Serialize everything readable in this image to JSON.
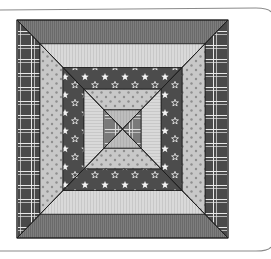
{
  "canvas": {
    "width": 271,
    "height": 259,
    "background": "#ffffff"
  },
  "frame": {
    "stroke": "#8a8a8a",
    "top_y": 8,
    "bottom_y": 251,
    "right_x": 268,
    "corner_radius": 12
  },
  "quilt": {
    "bounds": {
      "x0": 17,
      "y0": 20,
      "x1": 228,
      "y1": 238
    },
    "seam_color": "#1e1e1e",
    "rings": [
      {
        "name": "outer",
        "top_bottom": "dark-stripe",
        "left_right": "plaid"
      },
      {
        "name": "second",
        "top_bottom": "light-stripe",
        "left_right": "pink-dot"
      },
      {
        "name": "third",
        "top_bottom": "stars",
        "left_right": "stars"
      },
      {
        "name": "fourth",
        "top_bottom": "pink-dot",
        "left_right": "light-stripe"
      }
    ],
    "ring_insets": [
      0,
      23,
      46,
      67,
      87
    ],
    "center": {
      "top_bottom": "light-gray",
      "left_right": "plaid-mid"
    },
    "fabrics": {
      "dark-stripe": {
        "base": "#7d7d7d",
        "line": "#6a6a6a"
      },
      "light-stripe": {
        "base": "#d9d9d9",
        "line": "#c8c8c8"
      },
      "plaid": {
        "base": "#4a4a4a",
        "line": "#e8e8e8"
      },
      "pink-dot": {
        "base": "#c8c8c8",
        "dot": "#8e8e8e"
      },
      "stars": {
        "base": "#4c4c4c",
        "star": "#f2f2f2"
      },
      "light-gray": {
        "base": "#bdbdbd",
        "line": "#b0b0b0"
      },
      "plaid-mid": {
        "base": "#7a7a7a",
        "line": "#dcdcdc"
      }
    }
  }
}
